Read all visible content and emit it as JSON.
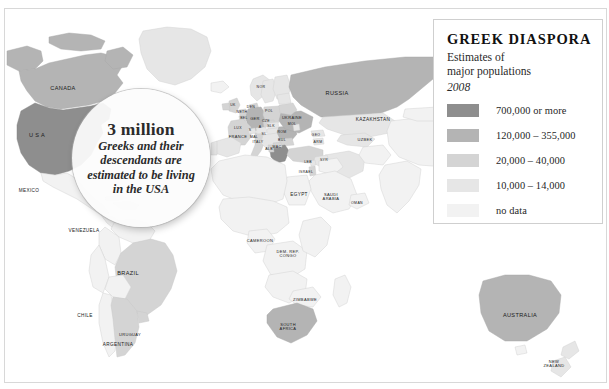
{
  "legend": {
    "title": "GREEK DIASPORA",
    "sub_line1": "Estimates of",
    "sub_line2": "major populations",
    "year": "2008",
    "entries": [
      {
        "label": "700,000 or more",
        "color": "#8e8e8e"
      },
      {
        "label": "120,000 – 355,000",
        "color": "#b4b4b4"
      },
      {
        "label": "20,000 – 40,000",
        "color": "#d4d4d4"
      },
      {
        "label": "10,000 – 14,000",
        "color": "#e6e6e6"
      },
      {
        "label": "no data",
        "color": "#f2f2f2"
      }
    ]
  },
  "callout": {
    "headline": "3 million",
    "body": "Greeks and their descendants are estimated to be living in the USA"
  },
  "map": {
    "ocean_color": "#ffffff",
    "border_color": "#c8c8c8",
    "labels": [
      {
        "name": "canada",
        "text": "CANADA",
        "x": 58,
        "y": 80,
        "size": "sz9"
      },
      {
        "name": "usa",
        "text": "U S A",
        "x": 32,
        "y": 127,
        "size": "sz9"
      },
      {
        "name": "mexico",
        "text": "MEXICO",
        "x": 24,
        "y": 182,
        "size": "sz8"
      },
      {
        "name": "venezuela",
        "text": "VENEZUELA",
        "x": 79,
        "y": 222,
        "size": "sz8"
      },
      {
        "name": "brazil",
        "text": "BRAZIL",
        "x": 123,
        "y": 265,
        "size": "sz9"
      },
      {
        "name": "chile",
        "text": "CHILE",
        "x": 80,
        "y": 307,
        "size": "sz8"
      },
      {
        "name": "uruguay",
        "text": "URUGUAY",
        "x": 125,
        "y": 326,
        "size": "sz7"
      },
      {
        "name": "argentina",
        "text": "ARGENTINA",
        "x": 113,
        "y": 336,
        "size": "sz8"
      },
      {
        "name": "russia",
        "text": "RUSSIA",
        "x": 332,
        "y": 85,
        "size": "sz9"
      },
      {
        "name": "kazakhstan",
        "text": "KAZAKHSTAN",
        "x": 368,
        "y": 111,
        "size": "sz8"
      },
      {
        "name": "uzbekistan",
        "text": "UZBEK",
        "x": 360,
        "y": 131,
        "size": "sz7"
      },
      {
        "name": "uk",
        "text": "UK",
        "x": 228,
        "y": 97,
        "size": "sz6"
      },
      {
        "name": "netherlands",
        "text": "NETH",
        "x": 237,
        "y": 104,
        "size": "sz6"
      },
      {
        "name": "denmark",
        "text": "DEN",
        "x": 246,
        "y": 99,
        "size": "sz6"
      },
      {
        "name": "norway",
        "text": "NOR",
        "x": 256,
        "y": 79,
        "size": "sz6"
      },
      {
        "name": "belgium",
        "text": "BEL",
        "x": 239,
        "y": 110,
        "size": "sz6"
      },
      {
        "name": "luxembourg",
        "text": "LUX",
        "x": 233,
        "y": 120,
        "size": "sz6"
      },
      {
        "name": "france",
        "text": "FRANCE",
        "x": 233,
        "y": 128,
        "size": "sz7"
      },
      {
        "name": "germany",
        "text": "GER",
        "x": 250,
        "y": 110,
        "size": "sz7"
      },
      {
        "name": "poland",
        "text": "POL",
        "x": 264,
        "y": 103,
        "size": "sz6"
      },
      {
        "name": "czech",
        "text": "CZE",
        "x": 261,
        "y": 113,
        "size": "sz6"
      },
      {
        "name": "austria",
        "text": "A",
        "x": 255,
        "y": 119,
        "size": "sz6"
      },
      {
        "name": "slovakia",
        "text": "SLK",
        "x": 266,
        "y": 118,
        "size": "sz6"
      },
      {
        "name": "switzerland",
        "text": "S",
        "x": 245,
        "y": 122,
        "size": "sz6"
      },
      {
        "name": "italy",
        "text": "ITALY",
        "x": 253,
        "y": 134,
        "size": "sz6"
      },
      {
        "name": "malta",
        "text": "MAL",
        "x": 249,
        "y": 129,
        "size": "sz6"
      },
      {
        "name": "slovenia",
        "text": "SL",
        "x": 259,
        "y": 126,
        "size": "sz6"
      },
      {
        "name": "ukraine",
        "text": "UKRAINE",
        "x": 287,
        "y": 109,
        "size": "sz7"
      },
      {
        "name": "moldova",
        "text": "MOL",
        "x": 287,
        "y": 116,
        "size": "sz6"
      },
      {
        "name": "romania",
        "text": "ROM",
        "x": 277,
        "y": 124,
        "size": "sz6"
      },
      {
        "name": "bulgaria",
        "text": "BUL",
        "x": 277,
        "y": 132,
        "size": "sz6"
      },
      {
        "name": "macedonia",
        "text": "MAC",
        "x": 272,
        "y": 139,
        "size": "sz6"
      },
      {
        "name": "albania",
        "text": "ALB",
        "x": 264,
        "y": 141,
        "size": "sz6"
      },
      {
        "name": "georgia",
        "text": "GEO",
        "x": 311,
        "y": 127,
        "size": "sz6"
      },
      {
        "name": "armenia",
        "text": "ARM",
        "x": 313,
        "y": 134,
        "size": "sz6"
      },
      {
        "name": "lebanon",
        "text": "LEB",
        "x": 303,
        "y": 154,
        "size": "sz6"
      },
      {
        "name": "syria",
        "text": "SYR",
        "x": 319,
        "y": 152,
        "size": "sz6"
      },
      {
        "name": "israel",
        "text": "ISRAEL",
        "x": 301,
        "y": 164,
        "size": "sz6"
      },
      {
        "name": "egypt",
        "text": "EGYPT",
        "x": 294,
        "y": 186,
        "size": "sz8"
      },
      {
        "name": "saudi-arabia",
        "text": "SAUDI\nARABIA",
        "x": 326,
        "y": 188,
        "size": "sz7"
      },
      {
        "name": "oman",
        "text": "OMAN",
        "x": 352,
        "y": 195,
        "size": "sz6"
      },
      {
        "name": "cameroon",
        "text": "CAMEROON",
        "x": 255,
        "y": 232,
        "size": "sz7"
      },
      {
        "name": "congo",
        "text": "DEM. REP.\nCONGO",
        "x": 283,
        "y": 245,
        "size": "sz7"
      },
      {
        "name": "zimbabwe",
        "text": "ZIMBABWE",
        "x": 300,
        "y": 291,
        "size": "sz7"
      },
      {
        "name": "south-africa",
        "text": "SOUTH\nAFRICA",
        "x": 283,
        "y": 318,
        "size": "sz7"
      },
      {
        "name": "australia",
        "text": "AUSTRALIA",
        "x": 515,
        "y": 307,
        "size": "sz9"
      },
      {
        "name": "new-zealand",
        "text": "NEW\nZEALAND",
        "x": 549,
        "y": 355,
        "size": "sz7"
      }
    ]
  }
}
